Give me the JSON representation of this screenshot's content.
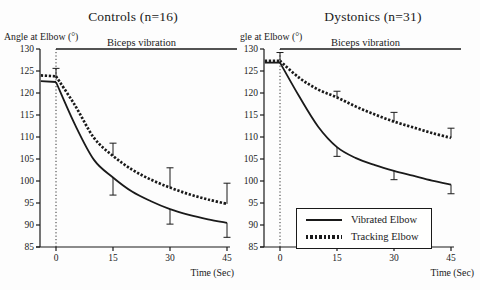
{
  "colors": {
    "ink": "#1a1a1a",
    "background": "#fdfdfd"
  },
  "legend": {
    "items": [
      {
        "label": "Vibrated Elbow",
        "style": "solid"
      },
      {
        "label": "Tracking Elbow",
        "style": "dotted"
      }
    ]
  },
  "chart_data": [
    {
      "type": "line",
      "title": "Controls (n=16)",
      "ylabel": "Angle at Elbow (°)",
      "xlabel": "Time (Sec)",
      "annotation": "Biceps vibration",
      "xlim": [
        -5,
        47
      ],
      "ylim": [
        85,
        130
      ],
      "xticks": [
        0,
        15,
        30,
        45
      ],
      "yticks": [
        85,
        90,
        95,
        100,
        105,
        110,
        115,
        120,
        125,
        130
      ],
      "grid": false,
      "x": [
        -4,
        0,
        5,
        10,
        15,
        20,
        25,
        30,
        35,
        40,
        45
      ],
      "series": [
        {
          "name": "Vibrated Elbow",
          "style": "solid",
          "values": [
            122.7,
            122.5,
            112.8,
            104.8,
            100.8,
            97.6,
            95.4,
            93.6,
            92.3,
            91.3,
            90.5
          ],
          "error_bars": [
            {
              "x": 15,
              "from": 100.8,
              "to": 96.8
            },
            {
              "x": 30,
              "from": 93.6,
              "to": 90.2
            },
            {
              "x": 45,
              "from": 90.5,
              "to": 87.2
            }
          ]
        },
        {
          "name": "Tracking Elbow",
          "style": "dotted",
          "values": [
            124.0,
            123.8,
            117.2,
            109.8,
            105.7,
            102.6,
            100.3,
            98.5,
            97.0,
            95.8,
            94.8
          ],
          "error_bars": [
            {
              "x": 0,
              "from": 123.8,
              "to": 125.6
            },
            {
              "x": 15,
              "from": 105.7,
              "to": 108.6
            },
            {
              "x": 30,
              "from": 98.5,
              "to": 103.0
            },
            {
              "x": 45,
              "from": 94.8,
              "to": 99.5
            }
          ]
        }
      ]
    },
    {
      "type": "line",
      "title": "Dystonics (n=31)",
      "ylabel": "Angle at Elbow (°)",
      "xlabel": "Time (Sec)",
      "annotation": "Biceps vibration",
      "xlim": [
        -5,
        47
      ],
      "ylim": [
        85,
        130
      ],
      "xticks": [
        0,
        15,
        30,
        45
      ],
      "yticks": [
        85,
        90,
        95,
        100,
        105,
        110,
        115,
        120,
        125,
        130
      ],
      "grid": false,
      "x": [
        -4,
        0,
        5,
        10,
        15,
        20,
        25,
        30,
        35,
        40,
        45
      ],
      "series": [
        {
          "name": "Vibrated Elbow",
          "style": "solid",
          "values": [
            126.9,
            126.9,
            119.3,
            112.4,
            107.7,
            105.2,
            103.6,
            102.3,
            101.2,
            100.1,
            99.2
          ],
          "error_bars": [
            {
              "x": 15,
              "from": 107.7,
              "to": 105.6
            },
            {
              "x": 30,
              "from": 102.3,
              "to": 100.3
            },
            {
              "x": 45,
              "from": 99.2,
              "to": 97.1
            }
          ]
        },
        {
          "name": "Tracking Elbow",
          "style": "dotted",
          "values": [
            127.3,
            127.3,
            123.5,
            120.8,
            119.0,
            116.9,
            115.1,
            113.5,
            112.2,
            110.9,
            109.8
          ],
          "error_bars": [
            {
              "x": 0,
              "from": 127.3,
              "to": 129.2
            },
            {
              "x": 15,
              "from": 119.0,
              "to": 120.4
            },
            {
              "x": 30,
              "from": 113.5,
              "to": 115.6
            },
            {
              "x": 45,
              "from": 109.8,
              "to": 112.0
            }
          ]
        }
      ]
    }
  ]
}
